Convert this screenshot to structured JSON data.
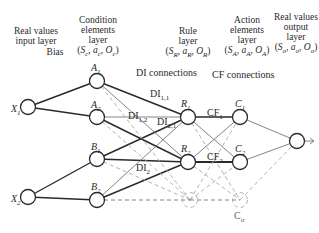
{
  "headers": {
    "input": [
      "Real values",
      "input layer"
    ],
    "bias": "Bias",
    "condition": [
      "Condition",
      "elements",
      "layer",
      "(S_c, a_c, O_c)"
    ],
    "rule": [
      "Rule",
      "layer",
      "(S_R, a_R, O_R)"
    ],
    "action": [
      "Action",
      "elements",
      "layer",
      "(S_A, a_A, O_A)"
    ],
    "output": [
      "Real values",
      "output",
      "layer",
      "(S_o, a_o, O_o)"
    ]
  },
  "connection_labels": {
    "di": "DI connections",
    "cf": "CF connections"
  },
  "nodes": {
    "X1": {
      "label": "X",
      "sub": "1",
      "x": 28,
      "y": 107
    },
    "X2": {
      "label": "X",
      "sub": "2",
      "x": 28,
      "y": 197
    },
    "A1": {
      "label": "A",
      "sub": "1",
      "x": 97,
      "y": 81
    },
    "A2": {
      "label": "A",
      "sub": "2",
      "x": 97,
      "y": 117
    },
    "B1": {
      "label": "B",
      "sub": "1",
      "x": 97,
      "y": 159
    },
    "B2": {
      "label": "B",
      "sub": "2",
      "x": 97,
      "y": 200
    },
    "R1": {
      "label": "R",
      "sub": "1",
      "x": 188,
      "y": 117
    },
    "R2": {
      "label": "R",
      "sub": "2",
      "x": 188,
      "y": 162
    },
    "C1": {
      "label": "C",
      "sub": "1",
      "x": 240,
      "y": 117
    },
    "C2": {
      "label": "C",
      "sub": "2",
      "x": 240,
      "y": 162
    },
    "Ca": {
      "label": "C",
      "sub": "α",
      "x": 240,
      "y": 200
    },
    "Out": {
      "label": "",
      "x": 297,
      "y": 141
    }
  },
  "edge_labels": {
    "di11": {
      "text": "DI",
      "sub": "1,1"
    },
    "di12": {
      "text": "DI",
      "sub": "1,2"
    },
    "di21": {
      "text": "DI",
      "sub": "2,1"
    },
    "di2": {
      "text": "DI",
      "sub": "2"
    },
    "cf1": {
      "text": "CF",
      "sub": "1"
    },
    "cf2": {
      "text": "CF",
      "sub": "2"
    }
  }
}
